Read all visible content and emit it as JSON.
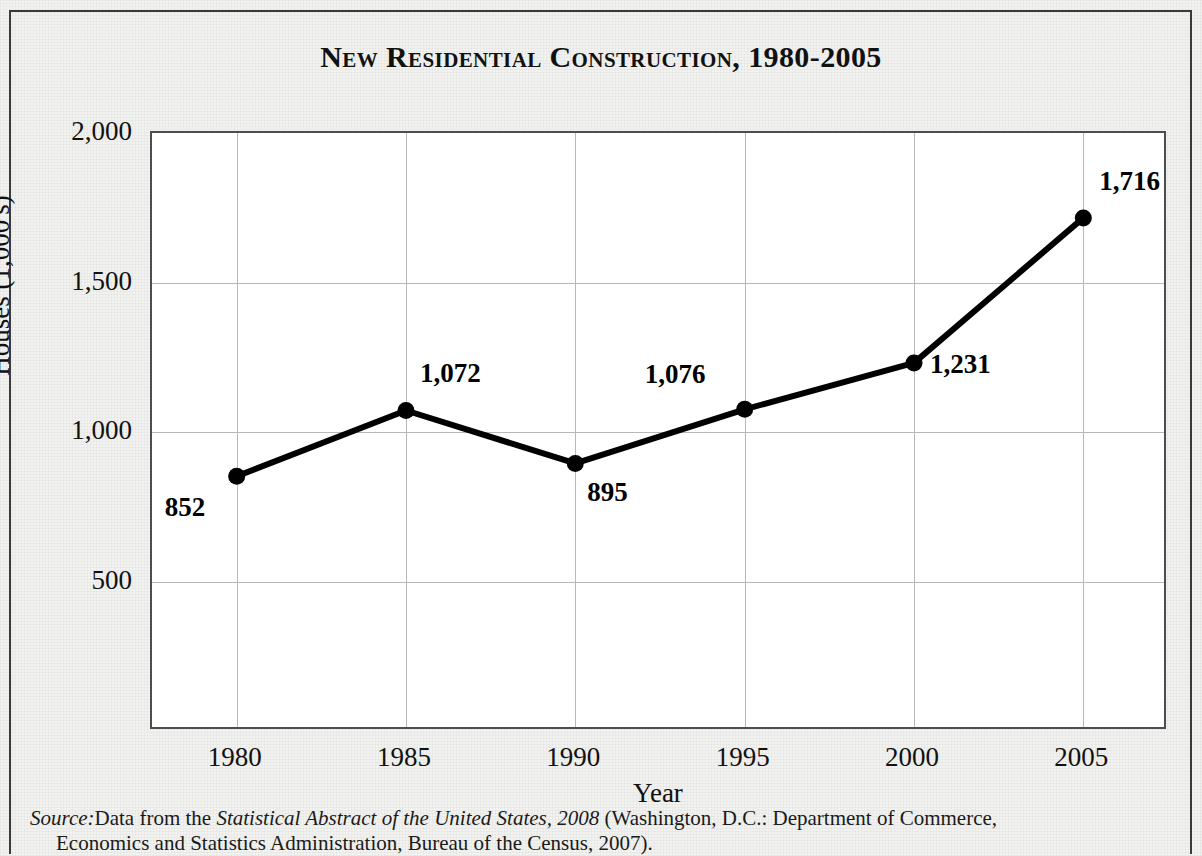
{
  "chart_data": {
    "type": "line",
    "title": "New Residential Construction, 1980-2005",
    "xlabel": "Year",
    "ylabel": "Houses (1,000's)",
    "categories": [
      1980,
      1985,
      1990,
      1995,
      2000,
      2005
    ],
    "x_tick_labels": [
      "1980",
      "1985",
      "1990",
      "1995",
      "2000",
      "2005"
    ],
    "values": [
      852,
      1072,
      895,
      1076,
      1231,
      1716
    ],
    "point_labels": [
      "852",
      "1,072",
      "895",
      "1,076",
      "1,231",
      "1,716"
    ],
    "y_tick_values": [
      500,
      1000,
      1500,
      2000
    ],
    "y_tick_labels": [
      "500",
      "1,000",
      "1,500",
      "2,000"
    ],
    "ylim": [
      0,
      2000
    ],
    "xlim": [
      1977.5,
      2007.5
    ],
    "grid": true,
    "legend": "none",
    "series_color": "#000000",
    "marker": "filled-circle"
  },
  "source": {
    "prefix": "Source:",
    "line1_a": "Data from the ",
    "line1_italic": "Statistical Abstract of the United States, 2008",
    "line1_b": " (Washington, D.C.: Department of Commerce,",
    "line2": "Economics and Statistics Administration, Bureau of the Census, 2007)."
  },
  "colors": {
    "page_background": "#f2f2f0",
    "plot_background": "#ffffff",
    "border": "#3a3a3a",
    "gridline": "#b8b8b8",
    "text": "#111111"
  }
}
